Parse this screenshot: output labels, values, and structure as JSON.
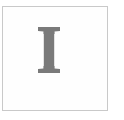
{
  "image": {
    "kind": "letter-tile",
    "width": 124,
    "height": 120,
    "background_color": "#ffffff",
    "description": "Serif capital letter I inside a thin light gray square frame"
  },
  "frame": {
    "border_color": "#c9c9c9",
    "border_width": 1,
    "fill_color": "#fefefe",
    "left": 2,
    "top": 6,
    "width": 106,
    "height": 105
  },
  "glyph": {
    "character": "I",
    "name": "capital-letter-i",
    "style": "serif",
    "color": "#7a7a7a",
    "stem_width": 7,
    "serif_width": 22,
    "cap_height": 66,
    "top": 26,
    "bottom": 92,
    "center_x": 48
  }
}
